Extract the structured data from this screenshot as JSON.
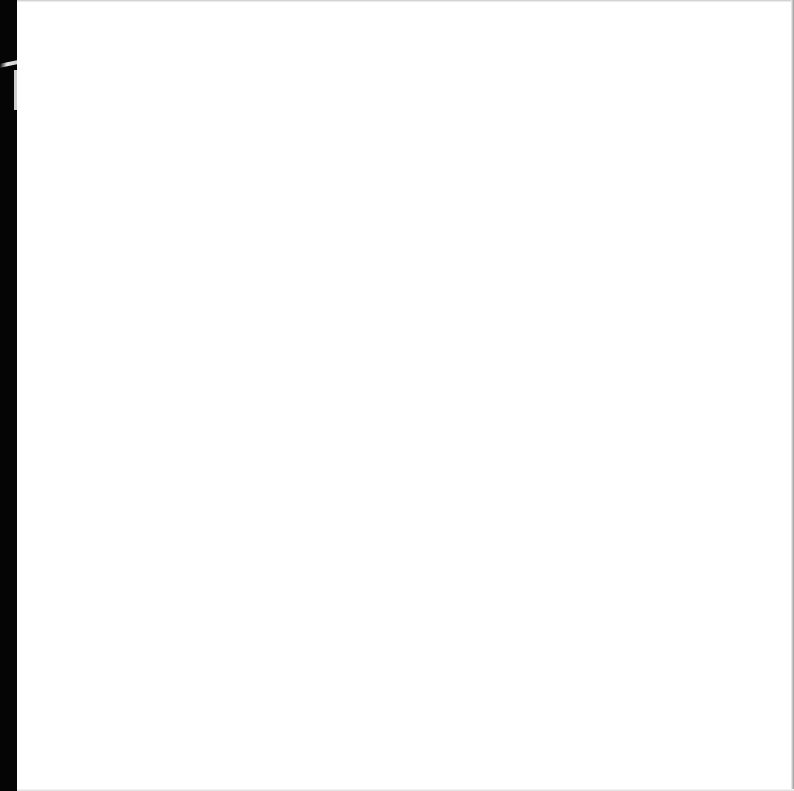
{
  "page": {
    "type": "blank-scanned-page",
    "content": "",
    "colors": {
      "paper": "#ffffff",
      "scan_edge_left": "#050505",
      "scan_edge_top": "#c8c8c8",
      "scan_edge_right": "#9a9a9a"
    }
  }
}
